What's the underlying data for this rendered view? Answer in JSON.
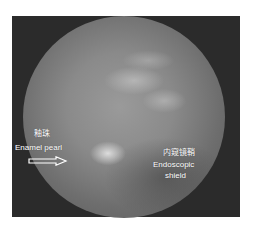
{
  "image": {
    "description": "Endoscopic view (circular scope image on dark frame)",
    "labels": {
      "enamel_pearl": {
        "chinese": "釉珠",
        "english": "Enamel pearl"
      },
      "endoscopic_shield": {
        "chinese": "内窥镜鞘",
        "english_line1": "Endoscopic",
        "english_line2": "shield"
      }
    },
    "icons": {
      "pointer": "arrow-right-icon"
    },
    "colors": {
      "frame": "#2b2b2b",
      "background": "#ffffff",
      "label_text": "#ffffff"
    }
  }
}
